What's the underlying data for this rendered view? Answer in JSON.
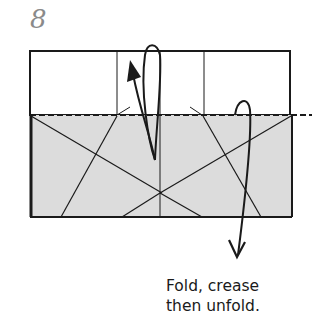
{
  "step": {
    "number": "8"
  },
  "instruction": {
    "line1": "Fold, crease",
    "line2": "then unfold."
  },
  "colors": {
    "line": "#1a1a1a",
    "shaded_fill": "#dcdcdc",
    "step_number": "#8a8a8a"
  },
  "diagram": {
    "type": "origami-step",
    "paper_top_flap": {
      "x": 30,
      "y": 51,
      "w": 260,
      "h": 64
    },
    "paper_shaded_region": {
      "x": 30,
      "y": 115,
      "w": 262,
      "h": 102
    },
    "fold_line": {
      "style": "valley-dashed",
      "y": 115,
      "x1": 30,
      "x2": 310
    },
    "arrows": [
      "fold-up-arrow",
      "fold-down-unfold-arrow"
    ]
  }
}
